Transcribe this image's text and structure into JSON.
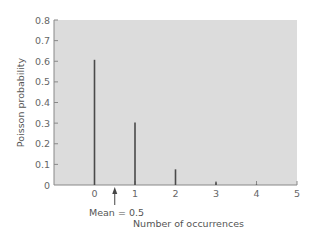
{
  "chart_data": {
    "type": "bar",
    "title": "",
    "xlabel": "Number of occurrences",
    "ylabel": "Poisson probability",
    "categories": [
      "0",
      "1",
      "2",
      "3",
      "4"
    ],
    "x": [
      0,
      1,
      2,
      3,
      4
    ],
    "values": [
      0.607,
      0.303,
      0.076,
      0.013,
      0.002
    ],
    "xlim": [
      -1,
      5
    ],
    "ylim": [
      0,
      0.8
    ],
    "xticks": [
      0,
      1,
      2,
      3,
      4,
      5
    ],
    "yticks": [
      0,
      0.1,
      0.2,
      0.3,
      0.4,
      0.5,
      0.6,
      0.7,
      0.8
    ],
    "ytick_labels": [
      "0",
      "0.1",
      "0.2",
      "0.3",
      "0.4",
      "0.5",
      "0.6",
      "0.7",
      "0.8"
    ],
    "xtick_labels": [
      "0",
      "1",
      "2",
      "3",
      "4",
      "5"
    ],
    "annotations": [
      {
        "text": "Mean = 0.5",
        "x": 0.5,
        "type": "arrow-up"
      }
    ],
    "grid": false,
    "legend": null,
    "colors": {
      "plot_background": "#dcdcdc",
      "bars": "#4a4a4a",
      "axis": "#888888"
    }
  }
}
